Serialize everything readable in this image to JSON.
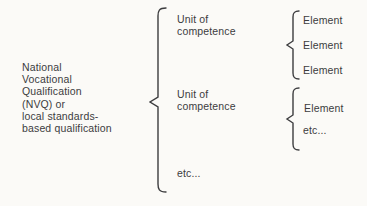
{
  "colors": {
    "ink": "#3c3c3e",
    "background": "#fbfaf7"
  },
  "diagram": {
    "qualification": {
      "label": "National\nVocational\nQualification\n(NVQ) or\nlocal standards-\nbased qualification"
    },
    "units": [
      {
        "label": "Unit of\ncompetence",
        "elements": [
          "Element",
          "Element",
          "Element"
        ]
      },
      {
        "label": "Unit of\ncompetence",
        "elements": [
          "Element",
          "etc..."
        ]
      },
      {
        "label": "etc..."
      }
    ]
  }
}
